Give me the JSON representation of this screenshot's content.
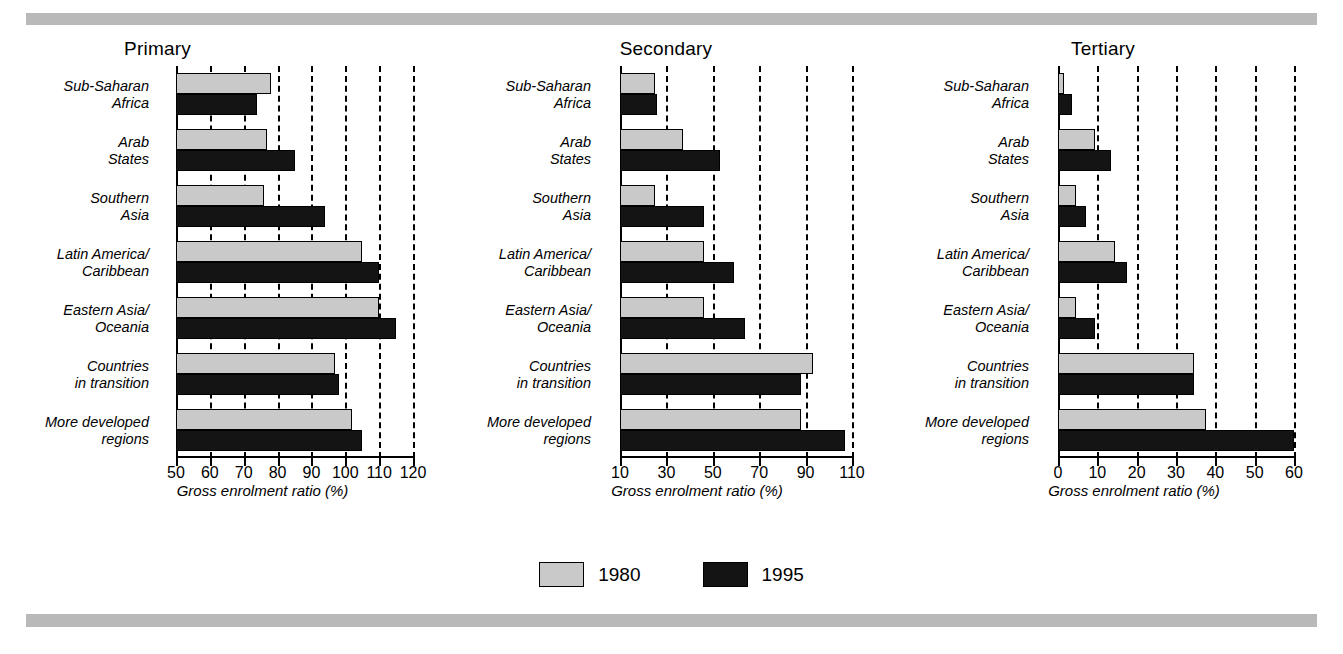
{
  "legend": {
    "entries": [
      {
        "label": "1980",
        "color": "#c9c9c9"
      },
      {
        "label": "1995",
        "color": "#141414"
      }
    ]
  },
  "categories": [
    "Sub-Saharan|Africa",
    "Arab|States",
    "Southern|Asia",
    "Latin America/|Caribbean",
    "Eastern Asia/|Oceania",
    "Countries|in transition",
    "More developed|regions"
  ],
  "category_lines": [
    [
      "Sub-Saharan",
      "Africa"
    ],
    [
      "Arab",
      "States"
    ],
    [
      "Southern",
      "Asia"
    ],
    [
      "Latin America/",
      "Caribbean"
    ],
    [
      "Eastern Asia/",
      "Oceania"
    ],
    [
      "Countries",
      "in transition"
    ],
    [
      "More developed",
      "regions"
    ]
  ],
  "axis_title": "Gross enrolment ratio (%)",
  "panels": [
    {
      "title": "Primary",
      "ticks": [
        "50",
        "60",
        "70",
        "80",
        "90",
        "100",
        "110",
        "120"
      ]
    },
    {
      "title": "Secondary",
      "ticks": [
        "10",
        "30",
        "50",
        "70",
        "90",
        "110"
      ]
    },
    {
      "title": "Tertiary",
      "ticks": [
        "0",
        "10",
        "20",
        "30",
        "40",
        "50",
        "60"
      ]
    }
  ],
  "chart_data": [
    {
      "type": "bar",
      "title": "Primary",
      "orientation": "horizontal",
      "xlabel": "Gross enrolment ratio (%)",
      "ylabel": "",
      "xlim": [
        50,
        120
      ],
      "xticks": [
        50,
        60,
        70,
        80,
        90,
        100,
        110,
        120
      ],
      "grid": true,
      "legend_position": "bottom-center",
      "categories": [
        "Sub-Saharan Africa",
        "Arab States",
        "Southern Asia",
        "Latin America/Caribbean",
        "Eastern Asia/Oceania",
        "Countries in transition",
        "More developed regions"
      ],
      "series": [
        {
          "name": "1980",
          "values": [
            78,
            77,
            76,
            105,
            110,
            97,
            102
          ]
        },
        {
          "name": "1995",
          "values": [
            74,
            85,
            94,
            110,
            115,
            98,
            105
          ]
        }
      ]
    },
    {
      "type": "bar",
      "title": "Secondary",
      "orientation": "horizontal",
      "xlabel": "Gross enrolment ratio (%)",
      "ylabel": "",
      "xlim": [
        10,
        110
      ],
      "xticks": [
        10,
        30,
        50,
        70,
        90,
        110
      ],
      "grid": true,
      "legend_position": "bottom-center",
      "categories": [
        "Sub-Saharan Africa",
        "Arab States",
        "Southern Asia",
        "Latin America/Caribbean",
        "Eastern Asia/Oceania",
        "Countries in transition",
        "More developed regions"
      ],
      "series": [
        {
          "name": "1980",
          "values": [
            25,
            37,
            25,
            46,
            46,
            93,
            88
          ]
        },
        {
          "name": "1995",
          "values": [
            26,
            53,
            46,
            59,
            64,
            88,
            107
          ]
        }
      ]
    },
    {
      "type": "bar",
      "title": "Tertiary",
      "orientation": "horizontal",
      "xlabel": "Gross enrolment ratio (%)",
      "ylabel": "",
      "xlim": [
        0,
        60
      ],
      "xticks": [
        0,
        10,
        20,
        30,
        40,
        50,
        60
      ],
      "grid": true,
      "legend_position": "bottom-center",
      "categories": [
        "Sub-Saharan Africa",
        "Arab States",
        "Southern Asia",
        "Latin America/Caribbean",
        "Eastern Asia/Oceania",
        "Countries in transition",
        "More developed regions"
      ],
      "series": [
        {
          "name": "1980",
          "values": [
            1.5,
            9.5,
            4.5,
            14.5,
            4.5,
            34.5,
            37.5
          ]
        },
        {
          "name": "1995",
          "values": [
            3.5,
            13.5,
            7,
            17.5,
            9.5,
            34.5,
            60
          ]
        }
      ]
    }
  ]
}
